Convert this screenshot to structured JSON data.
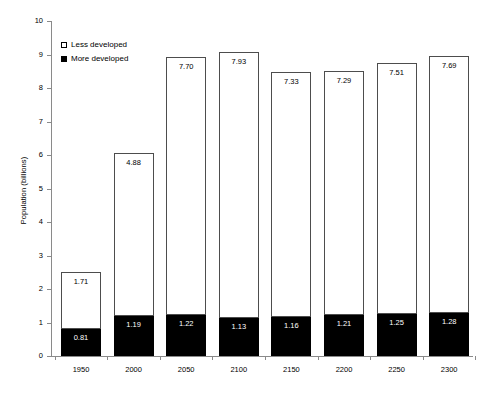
{
  "chart_data": {
    "type": "bar",
    "subtype": "stacked-bar",
    "title": "",
    "xlabel": "",
    "ylabel": "Population (billions)",
    "categories": [
      "1950",
      "2000",
      "2050",
      "2100",
      "2150",
      "2200",
      "2250",
      "2300"
    ],
    "series": [
      {
        "name": "More developed",
        "color": "#000000",
        "values": [
          0.81,
          1.19,
          1.22,
          1.13,
          1.16,
          1.21,
          1.25,
          1.28
        ],
        "labels": [
          "0.81",
          "1.19",
          "1.22",
          "1.13",
          "1.16",
          "1.21",
          "1.25",
          "1.28"
        ]
      },
      {
        "name": "Less developed",
        "color": "#ffffff",
        "values": [
          1.71,
          4.88,
          7.7,
          7.93,
          7.33,
          7.29,
          7.51,
          7.69
        ],
        "labels": [
          "1.71",
          "4.88",
          "7.70",
          "7.93",
          "7.33",
          "7.29",
          "7.51",
          "7.69"
        ]
      }
    ],
    "totals": [
      2.52,
      6.07,
      8.92,
      9.06,
      8.49,
      8.5,
      8.76,
      8.97
    ],
    "ylim": [
      0,
      10
    ],
    "yticks": [
      0,
      1,
      2,
      3,
      4,
      5,
      6,
      7,
      8,
      9,
      10
    ],
    "ytick_labels": [
      "0",
      "1",
      "2",
      "3",
      "4",
      "5",
      "6",
      "7",
      "8",
      "9",
      "10"
    ],
    "grid": false,
    "legend_position": "top-left",
    "legend": [
      {
        "label": "Less developed",
        "swatch": "open-square"
      },
      {
        "label": "More developed",
        "swatch": "filled-square"
      }
    ]
  }
}
